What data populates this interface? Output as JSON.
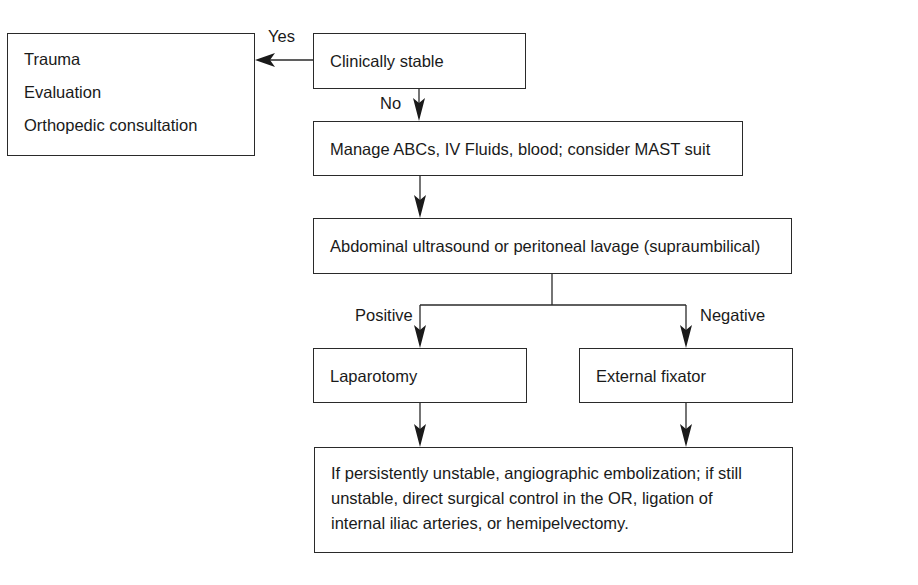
{
  "diagram": {
    "type": "flowchart",
    "nodes": {
      "outcome_stable": {
        "lines": [
          "Trauma",
          "Evaluation",
          "Orthopedic consultation"
        ]
      },
      "clinically_stable": {
        "label": "Clinically stable"
      },
      "manage": {
        "label": "Manage ABCs, IV Fluids, blood; consider MAST suit"
      },
      "abdominal": {
        "label": "Abdominal ultrasound or peritoneal lavage (supraumbilical)"
      },
      "laparotomy": {
        "label": "Laparotomy"
      },
      "external_fixator": {
        "label": "External fixator"
      },
      "final": {
        "lines": [
          "If persistently unstable, angiographic embolization; if still",
          "unstable, direct surgical control in the OR, ligation of",
          "internal iliac arteries, or hemipelvectomy."
        ]
      }
    },
    "edge_labels": {
      "yes": "Yes",
      "no": "No",
      "positive": "Positive",
      "negative": "Negative"
    },
    "edges": [
      {
        "from": "clinically_stable",
        "to": "outcome_stable",
        "label": "Yes"
      },
      {
        "from": "clinically_stable",
        "to": "manage",
        "label": "No"
      },
      {
        "from": "manage",
        "to": "abdominal",
        "label": ""
      },
      {
        "from": "abdominal",
        "to": "laparotomy",
        "label": "Positive"
      },
      {
        "from": "abdominal",
        "to": "external_fixator",
        "label": "Negative"
      },
      {
        "from": "laparotomy",
        "to": "final",
        "label": ""
      },
      {
        "from": "external_fixator",
        "to": "final",
        "label": ""
      }
    ],
    "colors": {
      "line": "#2a2a2a",
      "text": "#1a1a1a",
      "background": "#ffffff"
    }
  }
}
